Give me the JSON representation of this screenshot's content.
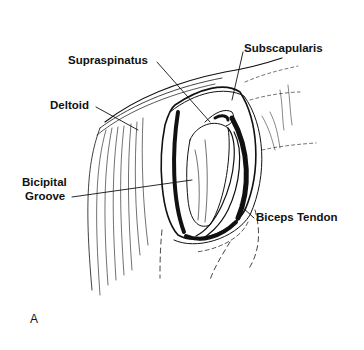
{
  "figure": {
    "panel_label": "A",
    "labels": {
      "supraspinatus": "Supraspinatus",
      "subscapularis": "Subscapularis",
      "deltoid": "Deltoid",
      "bicipital_line1": "Bicipital",
      "bicipital_line2": "Groove",
      "biceps_tendon": "Biceps Tendon"
    },
    "colors": {
      "ink": "#111111",
      "background": "#ffffff"
    }
  }
}
